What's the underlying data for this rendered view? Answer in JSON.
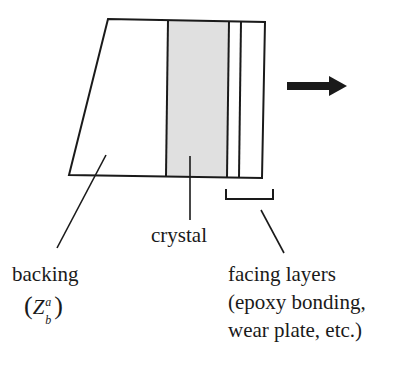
{
  "diagram": {
    "type": "transducer-layer-schematic",
    "direction_arrow": "right",
    "colors": {
      "stroke": "#1a1a1a",
      "crystal_fill": "#e0e0e0",
      "background": "#ffffff"
    },
    "labels": {
      "backing": "backing",
      "backing_impedance_open": "(",
      "backing_impedance_symbol": "Z",
      "backing_impedance_sub": "b",
      "backing_impedance_sup": "a",
      "backing_impedance_close": ")",
      "crystal": "crystal",
      "facing_title": "facing layers",
      "facing_line2": "(epoxy bonding,",
      "facing_line3": "wear plate, etc.)"
    },
    "layers": [
      "backing",
      "crystal",
      "epoxy bonding",
      "wear plate"
    ]
  }
}
